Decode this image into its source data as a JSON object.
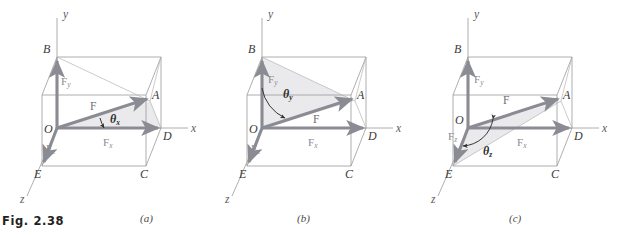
{
  "figure": {
    "caption": "Fig. 2.38",
    "accent_vector_color": "#8b8b93",
    "box_edge_color": "#9a9a9a",
    "shade_fill_color": "#e9e9ec",
    "background_color": "#ffffff"
  },
  "panels": [
    {
      "id": "a",
      "label": "(a)",
      "highlight_angle": "θ",
      "highlight_angle_subscript": "x",
      "axes": {
        "x": "x",
        "y": "y",
        "z": "z"
      },
      "vertices": {
        "O": "O",
        "A": "A",
        "B": "B",
        "C": "C",
        "D": "D",
        "E": "E"
      },
      "components": {
        "resultant": "F",
        "fx": "F",
        "fx_sub": "x",
        "fy": "F",
        "fy_sub": "y",
        "fz": "F",
        "fz_sub": "z"
      },
      "shaded_triangle": "O-D-A"
    },
    {
      "id": "b",
      "label": "(b)",
      "highlight_angle": "θ",
      "highlight_angle_subscript": "y",
      "axes": {
        "x": "x",
        "y": "y",
        "z": "z"
      },
      "vertices": {
        "O": "O",
        "A": "A",
        "B": "B",
        "C": "C",
        "D": "D",
        "E": "E"
      },
      "components": {
        "resultant": "F",
        "fx": "F",
        "fx_sub": "x",
        "fy": "F",
        "fy_sub": "y",
        "fz": "F",
        "fz_sub": "z"
      },
      "shaded_triangle": "O-B-A"
    },
    {
      "id": "c",
      "label": "(c)",
      "highlight_angle": "θ",
      "highlight_angle_subscript": "z",
      "axes": {
        "x": "x",
        "y": "y",
        "z": "z"
      },
      "vertices": {
        "O": "O",
        "A": "A",
        "B": "B",
        "C": "C",
        "D": "D",
        "E": "E"
      },
      "components": {
        "resultant": "F",
        "fx": "F",
        "fx_sub": "x",
        "fy": "F",
        "fy_sub": "y",
        "fz": "F",
        "fz_sub": "z"
      },
      "shaded_triangle": "O-E-A"
    }
  ]
}
